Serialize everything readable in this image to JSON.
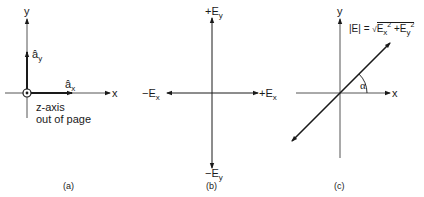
{
  "panels": {
    "a": {
      "caption": "(a)",
      "y_axis": "y",
      "x_axis": "x",
      "unit_y": "â",
      "unit_y_sub": "y",
      "unit_x": "â",
      "unit_x_sub": "x",
      "z_note_line1": "z-axis",
      "z_note_line2": "out of page"
    },
    "b": {
      "caption": "(b)",
      "plus_ey": "+E",
      "plus_ey_sub": "y",
      "minus_ey": "−E",
      "minus_ey_sub": "y",
      "plus_ex": "+E",
      "plus_ex_sub": "x",
      "minus_ex": "−E",
      "minus_ex_sub": "x"
    },
    "c": {
      "caption": "(c)",
      "y_axis": "y",
      "x_axis": "x",
      "angle": "α",
      "formula_lhs": "|E| = ",
      "formula_ex": "E",
      "formula_ex_sub": "x",
      "formula_exp": "2",
      "formula_plus": " +E",
      "formula_ey_sub": "y",
      "formula_exp2": "2"
    }
  }
}
